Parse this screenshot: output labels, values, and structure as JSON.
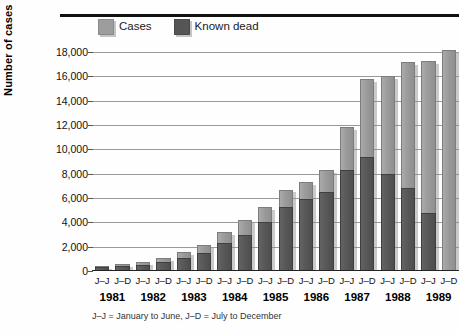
{
  "chart_data": {
    "type": "bar",
    "stacked": true,
    "title": "",
    "xlabel": "",
    "ylabel": "Number of cases",
    "ylim": [
      0,
      18000
    ],
    "ytick_labels": [
      "18,000",
      "16,000",
      "14,000",
      "12,000",
      "10,000",
      "8,000",
      "6,000",
      "4,000",
      "2,000",
      "0"
    ],
    "ytick_values": [
      18000,
      16000,
      14000,
      12000,
      10000,
      8000,
      6000,
      4000,
      2000,
      0
    ],
    "grid": true,
    "legend_position": "top",
    "categories": [
      "J–J",
      "J–D",
      "J–J",
      "J–D",
      "J–J",
      "J–D",
      "J–J",
      "J–D",
      "J–J",
      "J–D",
      "J–J",
      "J–D",
      "J–J",
      "J–D",
      "J–J",
      "J–D",
      "J–J",
      "J–D"
    ],
    "years": [
      "1981",
      "1982",
      "1983",
      "1984",
      "1985",
      "1986",
      "1987",
      "1988",
      "1989"
    ],
    "series": [
      {
        "name": "Known dead",
        "color": "#555555",
        "values": [
          300,
          400,
          500,
          700,
          1100,
          1500,
          2300,
          3000,
          4000,
          5300,
          5900,
          6500,
          8300,
          9400,
          8000,
          6800,
          4800,
          0
        ]
      },
      {
        "name": "Cases",
        "color": "#9d9d9d",
        "values": [
          150,
          200,
          250,
          350,
          450,
          600,
          900,
          1200,
          1300,
          1400,
          1400,
          1800,
          3500,
          6400,
          8000,
          10400,
          12500,
          18200
        ]
      }
    ],
    "totals": [
      450,
      600,
      750,
      1050,
      1550,
      2100,
      3200,
      4200,
      5300,
      6700,
      7300,
      8300,
      11800,
      15800,
      16000,
      17200,
      17300,
      18200
    ],
    "annotations": [
      "J–J = January to June,   J–D = July to December"
    ]
  },
  "legend": {
    "entries": [
      {
        "label": "Cases",
        "swatch": "cases-swatch",
        "color": "#9d9d9d"
      },
      {
        "label": "Known dead",
        "swatch": "known-dead-swatch",
        "color": "#555555"
      }
    ]
  },
  "axis": {
    "y_title": "Number of cases"
  },
  "footnote": "J–J = January to June,   J–D = July to December"
}
